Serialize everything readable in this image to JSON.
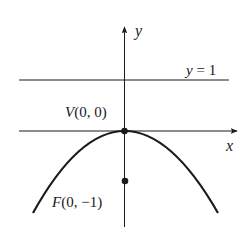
{
  "diagram": {
    "type": "parabola-focus-directrix",
    "equation_hint": "parabola opening downward, vertex at origin",
    "axes": {
      "x_label": "x",
      "y_label": "y"
    },
    "directrix": {
      "label": "y = 1",
      "label_parts": {
        "var": "y",
        "rest": " = 1"
      }
    },
    "vertex": {
      "label": "V(0, 0)",
      "label_parts": {
        "name": "V",
        "coords": "(0, 0)"
      }
    },
    "focus": {
      "label": "F(0, −1)",
      "label_parts": {
        "name": "F",
        "coords": "(0, −1)"
      }
    },
    "colors": {
      "stroke": "#1a1a1a",
      "background": "#ffffff"
    }
  }
}
